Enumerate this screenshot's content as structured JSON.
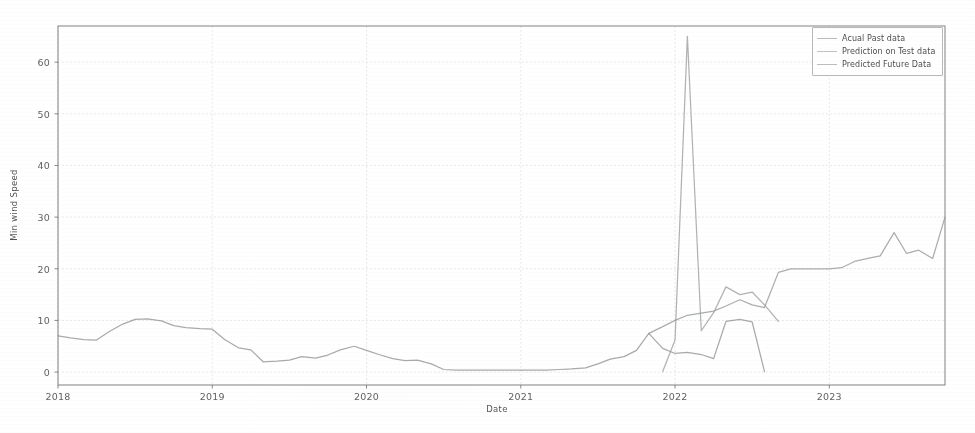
{
  "chart_data": {
    "type": "line",
    "title": "",
    "xlabel": "Date",
    "ylabel": "Min wind Speed",
    "xlim": [
      2018.0,
      2023.75
    ],
    "ylim": [
      -2.5,
      67
    ],
    "yticks": [
      0,
      10,
      20,
      30,
      40,
      50,
      60
    ],
    "ytick_labels": [
      "0",
      "10",
      "20",
      "30",
      "40",
      "50",
      "60"
    ],
    "xticks": [
      2018,
      2019,
      2020,
      2021,
      2022,
      2023
    ],
    "xtick_labels": [
      "2018",
      "2019",
      "2020",
      "2021",
      "2022",
      "2023"
    ],
    "grid": true,
    "legend_position": "upper right",
    "series": [
      {
        "name": "Acual Past data",
        "color": "#8f9296",
        "x": [
          2018.0,
          2018.08,
          2018.17,
          2018.25,
          2018.33,
          2018.42,
          2018.5,
          2018.58,
          2018.67,
          2018.75,
          2018.83,
          2018.92,
          2019.0,
          2019.08,
          2019.17,
          2019.25,
          2019.33,
          2019.42,
          2019.5,
          2019.58,
          2019.67,
          2019.75,
          2019.83,
          2019.92,
          2020.0,
          2020.08,
          2020.17,
          2020.25,
          2020.33,
          2020.42,
          2020.5,
          2020.58,
          2020.67,
          2020.75,
          2020.83,
          2020.92,
          2021.0,
          2021.08,
          2021.17,
          2021.25,
          2021.33,
          2021.42,
          2021.5,
          2021.58,
          2021.67,
          2021.75,
          2021.83,
          2021.92,
          2022.0,
          2022.08,
          2022.17,
          2022.25,
          2022.33,
          2022.42,
          2022.5,
          2022.58
        ],
        "values": [
          7.0,
          6.6,
          6.3,
          6.2,
          7.8,
          9.3,
          10.2,
          10.3,
          9.9,
          9.0,
          8.6,
          8.4,
          8.3,
          6.3,
          4.7,
          4.3,
          2.0,
          2.1,
          2.3,
          3.0,
          2.7,
          3.3,
          4.3,
          5.0,
          4.2,
          3.4,
          2.6,
          2.2,
          2.3,
          1.6,
          0.5,
          0.4,
          0.4,
          0.4,
          0.4,
          0.4,
          0.4,
          0.4,
          0.4,
          0.5,
          0.6,
          0.8,
          1.6,
          2.5,
          3.0,
          4.2,
          7.5,
          4.6,
          3.6,
          3.8,
          3.4,
          2.6,
          9.8,
          10.2,
          9.7,
          0.1
        ]
      },
      {
        "name": "Prediction on Test data",
        "color": "#9a9da1",
        "x": [
          2021.92,
          2022.0,
          2022.08,
          2022.17,
          2022.25,
          2022.33,
          2022.42,
          2022.5,
          2022.58,
          2022.67
        ],
        "values": [
          0.1,
          6.2,
          65.0,
          8.0,
          11.5,
          16.5,
          15.0,
          15.5,
          13.0,
          9.8
        ]
      },
      {
        "name": "Predicted Future Data",
        "color": "#949799",
        "x": [
          2021.83,
          2021.92,
          2022.0,
          2022.08,
          2022.17,
          2022.25,
          2022.33,
          2022.42,
          2022.5,
          2022.58,
          2022.67,
          2022.75,
          2022.83,
          2022.92,
          2023.0,
          2023.08,
          2023.17,
          2023.25,
          2023.33,
          2023.42,
          2023.5,
          2023.58,
          2023.67,
          2023.75
        ],
        "values": [
          7.5,
          8.8,
          10.0,
          11.0,
          11.4,
          11.8,
          12.8,
          14.0,
          13.0,
          12.5,
          19.3,
          20.0,
          20.0,
          20.0,
          20.0,
          20.2,
          21.5,
          22.0,
          22.5,
          27.0,
          23.0,
          23.6,
          22.0,
          30.0
        ]
      }
    ]
  },
  "axes": {
    "ylabel": "Min wind Speed",
    "xlabel": "Date"
  },
  "legend": {
    "items": [
      {
        "label": "Acual Past data"
      },
      {
        "label": "Prediction on Test data"
      },
      {
        "label": "Predicted Future Data"
      }
    ]
  }
}
